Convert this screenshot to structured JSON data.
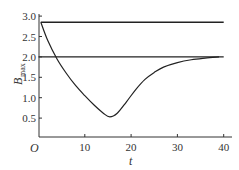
{
  "chart_data": {
    "type": "line",
    "title": "",
    "xlabel": "t",
    "ylabel": "B_max",
    "ylabel_main": "B",
    "ylabel_sub": "max",
    "origin_label": "O",
    "xlim": [
      0,
      42
    ],
    "ylim": [
      0,
      3.0
    ],
    "x_ticks": [
      10,
      20,
      30,
      40
    ],
    "x_tick_labels": [
      "10",
      "20",
      "30",
      "40"
    ],
    "y_ticks": [
      0.5,
      1.0,
      1.5,
      2.0,
      2.5,
      3.0
    ],
    "y_tick_labels": [
      "0.5",
      "1.0",
      "1.5",
      "2.0",
      "2.5",
      "3.0"
    ],
    "grid": false,
    "legend": null,
    "series": [
      {
        "name": "upper bound",
        "style": "horizontal line",
        "x": [
          0.5,
          40
        ],
        "y": [
          2.85,
          2.85
        ]
      },
      {
        "name": "lower bound",
        "style": "horizontal line",
        "x": [
          0,
          40
        ],
        "y": [
          2.0,
          2.0
        ]
      },
      {
        "name": "B_max(t)",
        "style": "curve",
        "x": [
          0.5,
          2,
          4,
          6,
          8,
          10,
          12,
          14,
          15.4,
          17,
          19,
          21,
          23,
          25,
          27,
          30,
          33,
          36,
          39
        ],
        "y": [
          2.85,
          2.4,
          1.95,
          1.6,
          1.3,
          1.05,
          0.82,
          0.62,
          0.53,
          0.62,
          0.9,
          1.2,
          1.45,
          1.62,
          1.75,
          1.86,
          1.93,
          1.97,
          2.0
        ]
      }
    ]
  }
}
